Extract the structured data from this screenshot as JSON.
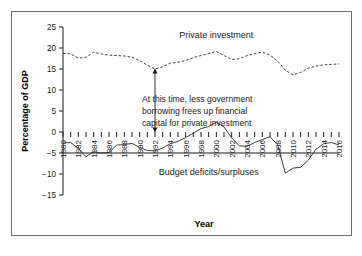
{
  "figure": {
    "border_color": "#6e6e6e",
    "background": "#ffffff"
  },
  "chart_data": {
    "type": "line",
    "title": "",
    "xlabel": "Year",
    "ylabel": "Percentage of GDP",
    "xlim": [
      1980,
      2016
    ],
    "ylim": [
      -15,
      25
    ],
    "ytick_values": [
      25,
      20,
      15,
      10,
      5,
      0,
      -5,
      -10,
      -15
    ],
    "ytick_labels": [
      "25",
      "20",
      "15",
      "10",
      "5",
      "0",
      "−5",
      "−10",
      "−15"
    ],
    "xtick_labels": [
      "1980",
      "1982",
      "1984",
      "1986",
      "1988",
      "1990",
      "1992",
      "1994",
      "1996",
      "1998",
      "2000",
      "2002",
      "2004",
      "2006",
      "2008",
      "2010",
      "2012",
      "2014",
      "2016"
    ],
    "xtick_minor_step": 1,
    "grid": false,
    "legend_position": "inline-annotations",
    "x": [
      1980,
      1981,
      1982,
      1983,
      1984,
      1985,
      1986,
      1987,
      1988,
      1989,
      1990,
      1991,
      1992,
      1993,
      1994,
      1995,
      1996,
      1997,
      1998,
      1999,
      2000,
      2001,
      2002,
      2003,
      2004,
      2005,
      2006,
      2007,
      2008,
      2009,
      2010,
      2011,
      2012,
      2013,
      2014,
      2015,
      2016
    ],
    "series": [
      {
        "name": "Private investment",
        "style": "dashed",
        "values": [
          18.7,
          18.6,
          17.6,
          17.8,
          19.0,
          18.6,
          18.3,
          18.2,
          18.1,
          17.8,
          17.0,
          15.9,
          15.0,
          15.5,
          16.4,
          16.6,
          17.0,
          17.7,
          18.2,
          18.7,
          19.2,
          18.2,
          17.3,
          17.4,
          18.2,
          18.7,
          19.0,
          18.3,
          16.9,
          14.7,
          13.6,
          14.2,
          15.2,
          15.7,
          16.0,
          16.1,
          16.2
        ]
      },
      {
        "name": "Budget deficits/surpluses",
        "style": "solid",
        "values": [
          -2.6,
          -2.5,
          -3.9,
          -5.9,
          -4.7,
          -5.0,
          -4.9,
          -3.1,
          -3.0,
          -2.7,
          -3.7,
          -4.4,
          -4.5,
          -3.8,
          -2.8,
          -2.2,
          -1.3,
          -0.3,
          0.8,
          1.3,
          2.3,
          1.2,
          -1.4,
          -3.3,
          -3.4,
          -2.5,
          -1.8,
          -1.1,
          -3.1,
          -9.8,
          -8.6,
          -8.4,
          -6.7,
          -4.1,
          -2.8,
          -2.5,
          -3.1
        ]
      }
    ],
    "annotations": [
      {
        "name": "private-investment-label",
        "text": "Private investment",
        "x": 2000,
        "y": 22.4
      },
      {
        "name": "budget-label",
        "text": "Budget deficits/surpluses",
        "x": 1999,
        "y": -10.2
      },
      {
        "name": "callout",
        "lines": [
          "At this time, less government",
          "borrowing frees up financial",
          "capital for private investment"
        ],
        "arrow": {
          "x": 1992,
          "y_top": 15.0,
          "y_bottom": 0.0,
          "double_headed": true
        }
      }
    ]
  }
}
